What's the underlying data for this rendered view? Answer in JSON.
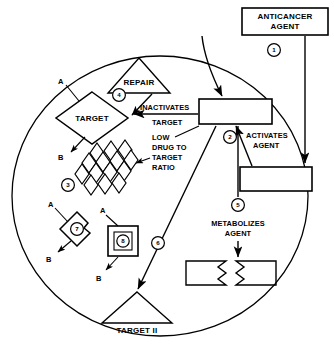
{
  "figure": {
    "cell_label": "cell-boundary"
  },
  "external_boxes": {
    "anticancer_agent": "ANTICANCER\nAGENT",
    "anticancer_agent_line1": "ANTICANCER",
    "anticancer_agent_line2": "AGENT"
  },
  "internal_boxes": {
    "active_drug_box_label": "",
    "activator_box_label": ""
  },
  "shapes": {
    "target_label": "TARGET",
    "repair_label": "REPAIR",
    "target_two_label": "TARGET II"
  },
  "process_labels": {
    "inactivates_target_line1": "INACTIVATES",
    "inactivates_target_line2": "TARGET",
    "low_drug_ratio_line1": "LOW",
    "low_drug_ratio_line2": "DRUG TO",
    "low_drug_ratio_line3": "TARGET",
    "low_drug_ratio_line4": "RATIO",
    "activates_agent_line1": "ACTIVATES",
    "activates_agent_line2": "AGENT",
    "metabolizes_agent_line1": "METABOLIZES",
    "metabolizes_agent_line2": "AGENT"
  },
  "ab_labels": {
    "target_a": "A",
    "target_b": "B",
    "shape7_a": "A",
    "shape7_b": "B",
    "shape8_a": "A",
    "shape8_b": "B"
  },
  "step_badges": [
    {
      "id": "1",
      "label": "1"
    },
    {
      "id": "2",
      "label": "2"
    },
    {
      "id": "3",
      "label": "3"
    },
    {
      "id": "4",
      "label": "4"
    },
    {
      "id": "5",
      "label": "5"
    },
    {
      "id": "6",
      "label": "6"
    },
    {
      "id": "7",
      "label": "7"
    },
    {
      "id": "8",
      "label": "8"
    }
  ],
  "colors": {
    "stroke": "#000000",
    "fill": "#ffffff",
    "background": "#ffffff"
  },
  "diamond_cluster": {
    "name": "low-drug-to-target-ratio-diamonds",
    "count": 14,
    "rows": 4
  }
}
